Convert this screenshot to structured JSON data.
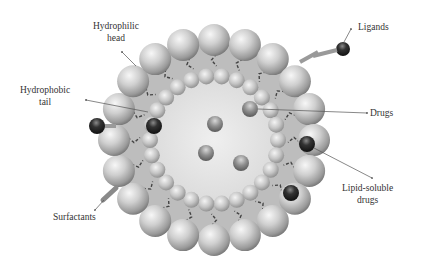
{
  "diagram": {
    "type": "liposome-nanocarrier-schematic",
    "labels": {
      "hydrophilic_head": {
        "line1": "Hydrophilic",
        "line2": "head"
      },
      "hydrophobic_tail": {
        "line1": "Hydrophobic",
        "line2": "tail"
      },
      "ligands": "Ligands",
      "drugs": "Drugs",
      "lipid_soluble_drugs": {
        "line1": "Lipid-soluble",
        "line2": "drugs"
      },
      "surfactants": "Surfactants"
    },
    "colors": {
      "bead_light": "#e6e6e6",
      "bead_mid": "#b5b5b5",
      "bead_dark": "#7d7d7d",
      "bilayer_fill": "#bdbdbd",
      "core_fill": "#e8e8e8",
      "dark_drug": "#2a2a2a",
      "arrow": "#555555",
      "tail": "#444444"
    },
    "geometry": {
      "center": [
        214,
        140
      ],
      "outer_radius": 100,
      "inner_radius": 64,
      "outer_bead_count": 20,
      "inner_bead_count": 26
    }
  }
}
